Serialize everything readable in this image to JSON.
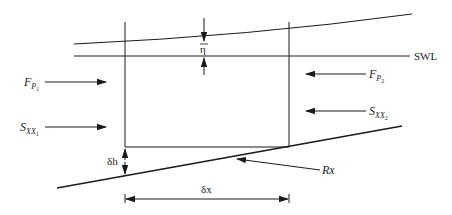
{
  "diagram": {
    "colors": {
      "line": "#1a1a1a",
      "background": "#ffffff"
    },
    "labels": {
      "swl": "SWL",
      "eta": "η",
      "fp1_main": "F",
      "fp1_sub": "P",
      "fp1_subsub": "1",
      "fp2_main": "F",
      "fp2_sub": "P",
      "fp2_subsub": "2",
      "sxx1_main": "S",
      "sxx1_sub": "XX",
      "sxx1_subsub": "1",
      "sxx2_main": "S",
      "sxx2_sub": "XX",
      "sxx2_subsub": "2",
      "rx": "Rx",
      "dh": "δh",
      "dx": "δx"
    },
    "forces": [
      {
        "name": "F_P1",
        "direction": "right",
        "side": "left"
      },
      {
        "name": "S_XX1",
        "direction": "right",
        "side": "left"
      },
      {
        "name": "F_P2",
        "direction": "left",
        "side": "right"
      },
      {
        "name": "S_XX2",
        "direction": "left",
        "side": "right"
      },
      {
        "name": "Rx",
        "direction": "toward-bed",
        "side": "bottom"
      }
    ],
    "dimensions": [
      {
        "name": "eta",
        "meaning": "mean water level set-up above SWL"
      },
      {
        "name": "delta_h",
        "meaning": "change in bed level across control volume"
      },
      {
        "name": "delta_x",
        "meaning": "width of control volume"
      }
    ]
  }
}
